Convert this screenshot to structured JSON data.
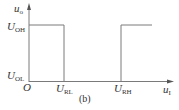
{
  "diagram": {
    "type": "hysteresis-transfer-characteristic",
    "caption": "(b)",
    "y_axis": {
      "label": "u",
      "label_sub": "o"
    },
    "x_axis": {
      "label": "u",
      "label_sub": "I"
    },
    "origin_label": "O",
    "levels": {
      "high": {
        "label": "U",
        "label_sub": "OH"
      },
      "low": {
        "label": "U",
        "label_sub": "OL"
      }
    },
    "thresholds": {
      "lower": {
        "label": "U",
        "label_sub": "RL"
      },
      "upper": {
        "label": "U",
        "label_sub": "RH"
      }
    },
    "colors": {
      "line": "#7a7a7a",
      "text": "#333333",
      "background": "#ffffff"
    }
  }
}
